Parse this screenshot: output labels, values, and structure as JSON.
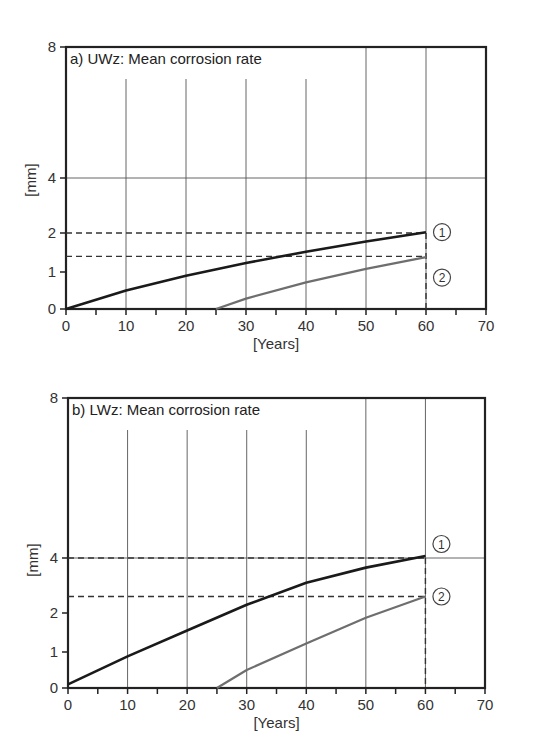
{
  "chart_data": [
    {
      "type": "line",
      "title": "a) UWz: Mean corrosion rate",
      "xlabel": "[Years]",
      "ylabel": "[mm]",
      "xlim": [
        0,
        70
      ],
      "ylim": [
        0,
        8
      ],
      "x_ticks": [
        0,
        10,
        20,
        30,
        40,
        50,
        60,
        70
      ],
      "y_ticks": [
        0,
        1,
        2,
        4,
        8
      ],
      "y_scale": "nonlinear (piecewise)",
      "grid": true,
      "series": [
        {
          "name": "1",
          "marker_label": "1",
          "color": "#1a1a1a",
          "x": [
            0,
            10,
            20,
            30,
            40,
            50,
            60
          ],
          "y": [
            0,
            0.5,
            0.9,
            1.23,
            1.52,
            1.78,
            2.03
          ]
        },
        {
          "name": "2",
          "marker_label": "2",
          "color": "#6e6e6e",
          "x": [
            25,
            30,
            40,
            50,
            60
          ],
          "y": [
            0,
            0.28,
            0.72,
            1.08,
            1.38
          ]
        }
      ],
      "reference_lines": [
        {
          "type": "horizontal",
          "y": 2.0,
          "style": "dashed"
        },
        {
          "type": "horizontal",
          "y": 1.4,
          "style": "dashed"
        },
        {
          "type": "vertical",
          "x": 60,
          "style": "dashed"
        }
      ],
      "annotations": [
        "1",
        "2"
      ]
    },
    {
      "type": "line",
      "title": "b) LWz: Mean corrosion rate",
      "xlabel": "[Years]",
      "ylabel": "[mm]",
      "xlim": [
        0,
        70
      ],
      "ylim": [
        0,
        8
      ],
      "x_ticks": [
        0,
        10,
        20,
        30,
        40,
        50,
        60,
        70
      ],
      "y_ticks": [
        0,
        1,
        2,
        4,
        8
      ],
      "y_scale": "nonlinear (piecewise)",
      "grid": true,
      "series": [
        {
          "name": "1",
          "marker_label": "1",
          "color": "#1a1a1a",
          "x": [
            0,
            10,
            20,
            30,
            40,
            50,
            60
          ],
          "y": [
            0.1,
            0.88,
            1.55,
            2.3,
            3.1,
            3.65,
            4.05
          ]
        },
        {
          "name": "2",
          "marker_label": "2",
          "color": "#6e6e6e",
          "x": [
            25,
            30,
            40,
            50,
            60
          ],
          "y": [
            0,
            0.5,
            1.22,
            1.88,
            2.6
          ]
        }
      ],
      "reference_lines": [
        {
          "type": "horizontal",
          "y": 4.0,
          "style": "dashed"
        },
        {
          "type": "horizontal",
          "y": 2.6,
          "style": "dashed"
        },
        {
          "type": "vertical",
          "x": 60,
          "style": "dashed"
        }
      ],
      "annotations": [
        "1",
        "2"
      ]
    }
  ],
  "panels": {
    "a": {
      "title": "a) UWz: Mean corrosion rate",
      "ylabel": "[mm]",
      "xlabel": "[Years]",
      "xticks": [
        "0",
        "10",
        "20",
        "30",
        "40",
        "50",
        "60",
        "70"
      ],
      "yticks": {
        "y0": "0",
        "y1": "1",
        "y2": "2",
        "y4": "4",
        "y8": "8"
      },
      "marker1": "1",
      "marker2": "2"
    },
    "b": {
      "title": "b) LWz: Mean corrosion rate",
      "ylabel": "[mm]",
      "xlabel": "[Years]",
      "xticks": [
        "0",
        "10",
        "20",
        "30",
        "40",
        "50",
        "60",
        "70"
      ],
      "yticks": {
        "y0": "0",
        "y1": "1",
        "y2": "2",
        "y4": "4",
        "y8": "8"
      },
      "marker1": "1",
      "marker2": "2"
    }
  },
  "colors": {
    "series1": "#1a1a1a",
    "series2": "#6e6e6e",
    "grid": "#555555",
    "axis": "#222222"
  }
}
